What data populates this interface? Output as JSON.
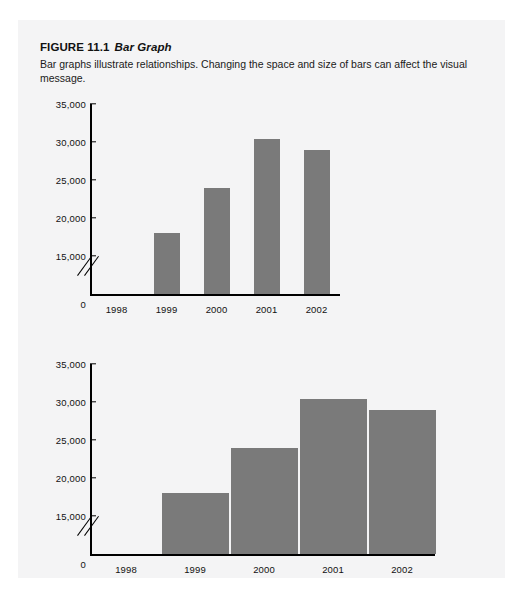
{
  "figure": {
    "label": "FIGURE 11.1",
    "name": "Bar Graph",
    "description": "Bar graphs illustrate relationships. Changing the space and size of bars can affect the visual message."
  },
  "style": {
    "panel_background": "#f4f4f5",
    "page_background": "#ffffff",
    "bar_color": "#7a7a7a",
    "axis_color": "#000000",
    "text_color": "#111111"
  },
  "chart_data": [
    {
      "id": "top-chart",
      "type": "bar",
      "title": "",
      "xlabel": "",
      "ylabel": "",
      "categories": [
        "1998",
        "1999",
        "2000",
        "2001",
        "2002"
      ],
      "values": [
        14500,
        18000,
        24000,
        30400,
        29000
      ],
      "ytick_labels": [
        "35,000",
        "30,000",
        "25,000",
        "20,000",
        "15,000",
        "0"
      ],
      "ytick_values": [
        35000,
        30000,
        25000,
        20000,
        15000,
        0
      ],
      "ylim": [
        0,
        35000
      ],
      "axis_break": true,
      "axis_break_between": [
        0,
        15000
      ],
      "grid": false,
      "legend": "none",
      "bar_style": "narrow-bars-wide-gaps"
    },
    {
      "id": "bottom-chart",
      "type": "bar",
      "title": "",
      "xlabel": "",
      "ylabel": "",
      "categories": [
        "1998",
        "1999",
        "2000",
        "2001",
        "2002"
      ],
      "values": [
        14500,
        18000,
        24000,
        30400,
        29000
      ],
      "ytick_labels": [
        "35,000",
        "30,000",
        "25,000",
        "20,000",
        "15,000",
        "0"
      ],
      "ytick_values": [
        35000,
        30000,
        25000,
        20000,
        15000,
        0
      ],
      "ylim": [
        0,
        35000
      ],
      "axis_break": true,
      "axis_break_between": [
        0,
        15000
      ],
      "grid": false,
      "legend": "none",
      "bar_style": "wide-bars-touching"
    }
  ]
}
